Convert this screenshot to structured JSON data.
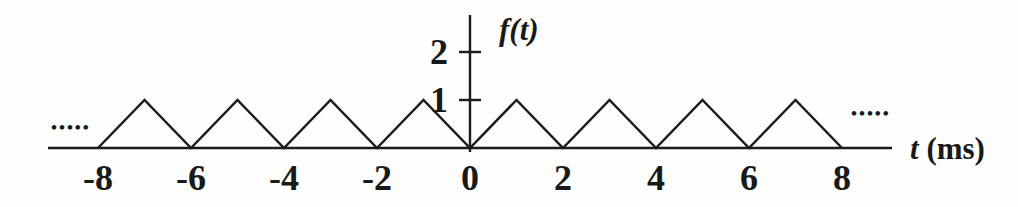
{
  "figure": {
    "paper_color": "#fdfdfc",
    "ink_color": "#1b1b1b"
  },
  "chart_data": {
    "type": "line",
    "title": "",
    "x_axis": {
      "variable": "t",
      "unit": "(ms)",
      "label": "t (ms)",
      "ticks": [
        -8,
        -6,
        -4,
        -2,
        0,
        2,
        4,
        6,
        8
      ],
      "range": [
        -9,
        9
      ]
    },
    "y_axis": {
      "label": "f(t)",
      "ticks": [
        1,
        2
      ],
      "range": [
        0,
        2.6
      ]
    },
    "series": [
      {
        "name": "f(t)",
        "points": [
          [
            -8,
            0
          ],
          [
            -7,
            1
          ],
          [
            -6,
            0
          ],
          [
            -5,
            1
          ],
          [
            -4,
            0
          ],
          [
            -3,
            1
          ],
          [
            -2,
            0
          ],
          [
            -1,
            1
          ],
          [
            0,
            0
          ],
          [
            1,
            1
          ],
          [
            2,
            0
          ],
          [
            3,
            1
          ],
          [
            4,
            0
          ],
          [
            5,
            1
          ],
          [
            6,
            0
          ],
          [
            7,
            1
          ],
          [
            8,
            0
          ]
        ]
      }
    ],
    "waveform": {
      "shape": "triangular",
      "period_ms": 2,
      "amplitude": 1,
      "peaks_at": [
        -7,
        -5,
        -3,
        -1,
        1,
        3,
        5,
        7
      ],
      "zeros_at": [
        -8,
        -6,
        -4,
        -2,
        0,
        2,
        4,
        6,
        8
      ]
    },
    "continuation_left": "•••••",
    "continuation_right": "•••••",
    "grid": false,
    "legend": false
  }
}
